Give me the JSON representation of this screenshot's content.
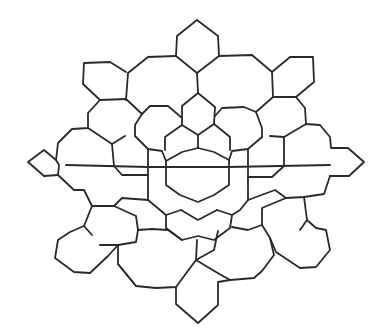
{
  "diagram": {
    "type": "geometric-tiling-line-drawing",
    "stroke_color": "#2a2a2a",
    "background_color": "#ffffff",
    "paths": [
      [
        [
          197,
          20
        ],
        [
          218,
          36
        ],
        [
          219,
          56
        ],
        [
          197,
          73
        ],
        [
          176,
          56
        ],
        [
          177,
          36
        ],
        [
          197,
          20
        ]
      ],
      [
        [
          176,
          56
        ],
        [
          148,
          57
        ],
        [
          128,
          73
        ],
        [
          126,
          100
        ]
      ],
      [
        [
          219,
          56
        ],
        [
          252,
          55
        ],
        [
          272,
          72
        ],
        [
          273,
          97
        ]
      ],
      [
        [
          197,
          73
        ],
        [
          198,
          93
        ]
      ],
      [
        [
          126,
          72
        ],
        [
          110,
          62
        ],
        [
          84,
          63
        ],
        [
          83,
          84
        ],
        [
          100,
          100
        ],
        [
          126,
          99
        ]
      ],
      [
        [
          272,
          72
        ],
        [
          290,
          57
        ],
        [
          313,
          57
        ],
        [
          314,
          82
        ],
        [
          296,
          97
        ],
        [
          273,
          97
        ]
      ],
      [
        [
          100,
          100
        ],
        [
          88,
          113
        ],
        [
          88,
          128
        ],
        [
          72,
          129
        ],
        [
          58,
          143
        ],
        [
          56,
          160
        ],
        [
          59,
          165
        ],
        [
          58,
          175
        ],
        [
          74,
          190
        ]
      ],
      [
        [
          126,
          99
        ],
        [
          142,
          114
        ]
      ],
      [
        [
          296,
          97
        ],
        [
          305,
          108
        ],
        [
          306,
          124
        ],
        [
          320,
          125
        ],
        [
          330,
          137
        ],
        [
          331,
          148
        ],
        [
          348,
          148
        ],
        [
          364,
          162
        ],
        [
          349,
          176
        ],
        [
          330,
          176
        ]
      ],
      [
        [
          273,
          97
        ],
        [
          256,
          112
        ]
      ],
      [
        [
          198,
          93
        ],
        [
          182,
          106
        ],
        [
          182,
          125
        ],
        [
          198,
          135
        ],
        [
          214,
          124
        ],
        [
          215,
          107
        ],
        [
          198,
          93
        ]
      ],
      [
        [
          142,
          114
        ],
        [
          150,
          106
        ],
        [
          168,
          106
        ],
        [
          182,
          118
        ]
      ],
      [
        [
          256,
          112
        ],
        [
          244,
          107
        ],
        [
          222,
          108
        ],
        [
          215,
          116
        ]
      ],
      [
        [
          142,
          114
        ],
        [
          135,
          125
        ],
        [
          135,
          136
        ]
      ],
      [
        [
          256,
          112
        ],
        [
          262,
          128
        ],
        [
          262,
          137
        ]
      ],
      [
        [
          88,
          128
        ],
        [
          112,
          144
        ]
      ],
      [
        [
          306,
          124
        ],
        [
          284,
          137
        ]
      ],
      [
        [
          135,
          136
        ],
        [
          148,
          149
        ],
        [
          162,
          151
        ],
        [
          166,
          161
        ]
      ],
      [
        [
          262,
          137
        ],
        [
          248,
          149
        ],
        [
          232,
          151
        ],
        [
          229,
          160
        ]
      ],
      [
        [
          182,
          125
        ],
        [
          165,
          137
        ],
        [
          165,
          150
        ]
      ],
      [
        [
          214,
          124
        ],
        [
          230,
          137
        ],
        [
          230,
          150
        ]
      ],
      [
        [
          198,
          135
        ],
        [
          198,
          148
        ]
      ],
      [
        [
          112,
          144
        ],
        [
          125,
          136
        ]
      ],
      [
        [
          284,
          137
        ],
        [
          270,
          136
        ]
      ],
      [
        [
          112,
          144
        ],
        [
          114,
          166
        ],
        [
          122,
          175
        ],
        [
          148,
          175
        ]
      ],
      [
        [
          284,
          137
        ],
        [
          284,
          166
        ],
        [
          272,
          177
        ],
        [
          248,
          177
        ]
      ],
      [
        [
          148,
          149
        ],
        [
          148,
          175
        ],
        [
          148,
          200
        ]
      ],
      [
        [
          248,
          149
        ],
        [
          248,
          177
        ],
        [
          248,
          200
        ]
      ],
      [
        [
          166,
          161
        ],
        [
          182,
          152
        ],
        [
          198,
          148
        ],
        [
          214,
          152
        ],
        [
          229,
          160
        ]
      ],
      [
        [
          166,
          161
        ],
        [
          166,
          185
        ],
        [
          180,
          195
        ],
        [
          198,
          202
        ],
        [
          214,
          195
        ],
        [
          229,
          185
        ],
        [
          229,
          160
        ]
      ],
      [
        [
          56,
          160
        ],
        [
          44,
          150
        ],
        [
          28,
          162
        ],
        [
          44,
          176
        ],
        [
          58,
          175
        ]
      ],
      [
        [
          66,
          165
        ],
        [
          148,
          167
        ],
        [
          229,
          167
        ],
        [
          330,
          165
        ]
      ],
      [
        [
          74,
          190
        ],
        [
          84,
          190
        ],
        [
          92,
          206
        ],
        [
          114,
          206
        ],
        [
          122,
          198
        ],
        [
          148,
          200
        ]
      ],
      [
        [
          330,
          176
        ],
        [
          324,
          194
        ],
        [
          304,
          197
        ],
        [
          286,
          198
        ],
        [
          275,
          190
        ],
        [
          248,
          200
        ]
      ],
      [
        [
          114,
          206
        ],
        [
          136,
          216
        ],
        [
          138,
          230
        ],
        [
          152,
          229
        ],
        [
          168,
          230
        ]
      ],
      [
        [
          286,
          198
        ],
        [
          262,
          208
        ],
        [
          262,
          225
        ],
        [
          248,
          230
        ],
        [
          232,
          227
        ]
      ],
      [
        [
          148,
          200
        ],
        [
          160,
          210
        ],
        [
          166,
          215
        ],
        [
          181,
          210
        ]
      ],
      [
        [
          248,
          200
        ],
        [
          240,
          210
        ],
        [
          232,
          215
        ],
        [
          217,
          210
        ]
      ],
      [
        [
          181,
          210
        ],
        [
          198,
          220
        ],
        [
          217,
          210
        ]
      ],
      [
        [
          166,
          215
        ],
        [
          166,
          228
        ],
        [
          182,
          240
        ],
        [
          198,
          236
        ],
        [
          214,
          240
        ],
        [
          230,
          228
        ],
        [
          232,
          215
        ]
      ],
      [
        [
          168,
          230
        ],
        [
          182,
          240
        ]
      ],
      [
        [
          92,
          206
        ],
        [
          84,
          226
        ],
        [
          92,
          235
        ]
      ],
      [
        [
          304,
          197
        ],
        [
          307,
          220
        ],
        [
          300,
          230
        ]
      ],
      [
        [
          84,
          226
        ],
        [
          70,
          232
        ],
        [
          58,
          240
        ],
        [
          55,
          258
        ],
        [
          74,
          272
        ],
        [
          90,
          273
        ],
        [
          108,
          256
        ],
        [
          118,
          245
        ],
        [
          136,
          242
        ],
        [
          138,
          230
        ]
      ],
      [
        [
          307,
          220
        ],
        [
          316,
          228
        ],
        [
          326,
          230
        ],
        [
          330,
          250
        ],
        [
          316,
          267
        ],
        [
          300,
          268
        ],
        [
          276,
          252
        ],
        [
          270,
          238
        ],
        [
          262,
          225
        ]
      ],
      [
        [
          118,
          245
        ],
        [
          118,
          264
        ],
        [
          136,
          286
        ],
        [
          156,
          288
        ],
        [
          176,
          287
        ],
        [
          196,
          260
        ],
        [
          197,
          240
        ]
      ],
      [
        [
          196,
          260
        ],
        [
          214,
          250
        ],
        [
          218,
          231
        ]
      ],
      [
        [
          270,
          238
        ],
        [
          274,
          255
        ],
        [
          262,
          271
        ],
        [
          254,
          278
        ],
        [
          230,
          280
        ],
        [
          216,
          272
        ],
        [
          196,
          260
        ]
      ],
      [
        [
          176,
          287
        ],
        [
          176,
          304
        ],
        [
          198,
          323
        ],
        [
          218,
          305
        ],
        [
          218,
          282
        ],
        [
          230,
          280
        ]
      ],
      [
        [
          100,
          245
        ],
        [
          118,
          245
        ]
      ],
      [
        [
          136,
          286
        ],
        [
          118,
          264
        ]
      ]
    ]
  }
}
